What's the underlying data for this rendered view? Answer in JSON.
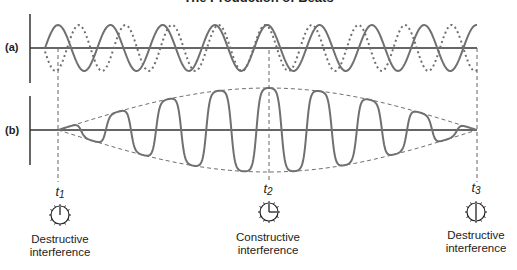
{
  "title": "The Production of Beats",
  "panels": {
    "a": {
      "label": "(a)"
    },
    "b": {
      "label": "(b)"
    }
  },
  "markers": [
    {
      "time_symbol": "t",
      "time_index": "1",
      "clock": "12:00",
      "caption_line1": "Destructive",
      "caption_line2": "interference"
    },
    {
      "time_symbol": "t",
      "time_index": "2",
      "clock": "3:00",
      "caption_line1": "Constructive",
      "caption_line2": "interference"
    },
    {
      "time_symbol": "t",
      "time_index": "3",
      "clock": "6:00",
      "caption_line1": "Destructive",
      "caption_line2": "interference"
    }
  ],
  "colors": {
    "wave": "#707070",
    "axis": "#333333",
    "text": "#222222",
    "background": "#ffffff"
  },
  "chart_data": {
    "type": "line",
    "title": "The Production of Beats",
    "panels": [
      {
        "label": "(a)",
        "description": "Two superimposed waves of slightly different frequency",
        "series": [
          {
            "name": "wave 1 (solid)",
            "style": "solid",
            "peak_x_px": [
              58,
              108,
              160,
              212,
              267,
              320,
              374,
              427,
              475
            ]
          },
          {
            "name": "wave 2 (dotted)",
            "style": "dotted",
            "peak_x_px": [
              82,
              128,
              175,
              220,
              315,
              362,
              407,
              452
            ]
          }
        ]
      },
      {
        "label": "(b)",
        "description": "Resulting beat waveform with dashed amplitude envelope",
        "series": [
          {
            "name": "sum wave",
            "style": "solid",
            "peaks_x_px": [
              77,
              117,
              167,
              218,
              269,
              320,
              370,
              418,
              458
            ],
            "relative_amplitude": [
              0.05,
              0.4,
              0.7,
              0.93,
              1.0,
              0.93,
              0.75,
              0.47,
              0.12
            ]
          },
          {
            "name": "envelope",
            "style": "dashed"
          }
        ]
      }
    ],
    "annotations": [
      {
        "x": "t1",
        "text": "Destructive interference"
      },
      {
        "x": "t2",
        "text": "Constructive interference"
      },
      {
        "x": "t3",
        "text": "Destructive interference"
      }
    ],
    "grid": false,
    "legend": "none"
  }
}
